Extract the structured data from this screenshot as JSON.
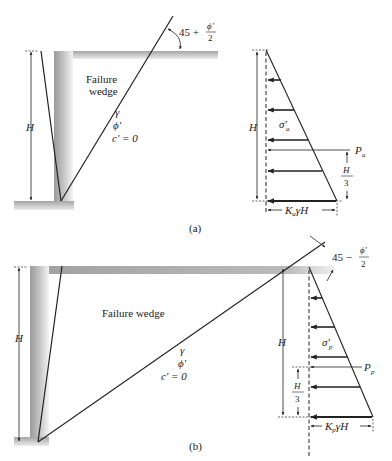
{
  "figure": {
    "panel_a": {
      "caption": "(a)",
      "wedge_label_line1": "Failure",
      "wedge_label_line2": "wedge",
      "soil_gamma": "γ",
      "soil_phi": "ϕ′",
      "soil_c": "c′ = 0",
      "angle_prefix": "45 +",
      "angle_num": "ϕ′",
      "angle_den": "2",
      "height_label": "H",
      "stress_label": "σ′",
      "stress_sub": "a",
      "force_label": "P",
      "force_sub": "a",
      "third_num": "H",
      "third_den": "3",
      "base_label_K": "K",
      "base_label_sub": "a",
      "base_label_rest": "γH"
    },
    "panel_b": {
      "caption": "(b)",
      "wedge_label": "Failure wedge",
      "soil_gamma": "γ",
      "soil_phi": "ϕ′",
      "soil_c": "c′ = 0",
      "angle_prefix": "45 −",
      "angle_num": "ϕ′",
      "angle_den": "2",
      "height_label": "H",
      "stress_label": "σ′",
      "stress_sub": "p",
      "force_label": "P",
      "force_sub": "p",
      "third_num": "H",
      "third_den": "3",
      "base_label_K": "K",
      "base_label_sub": "p",
      "base_label_rest": "γH"
    },
    "colors": {
      "line": "#222222",
      "ground_shade": "#b5b5b5",
      "wall_shade": "#a8a8a8"
    }
  }
}
